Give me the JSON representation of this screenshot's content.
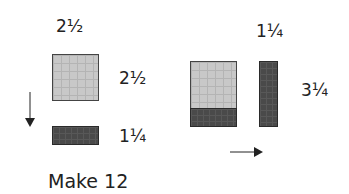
{
  "left": {
    "top_label": "2½",
    "square_side_label": "2½",
    "bar_side_label": "1¼",
    "arrow_direction": "down"
  },
  "right": {
    "top_label": "1¼",
    "side_label": "3¼",
    "arrow_direction": "right"
  },
  "caption": "Make 12",
  "colors": {
    "light_tile": "#c8c8c8",
    "dark_tile": "#4a4a4a"
  }
}
